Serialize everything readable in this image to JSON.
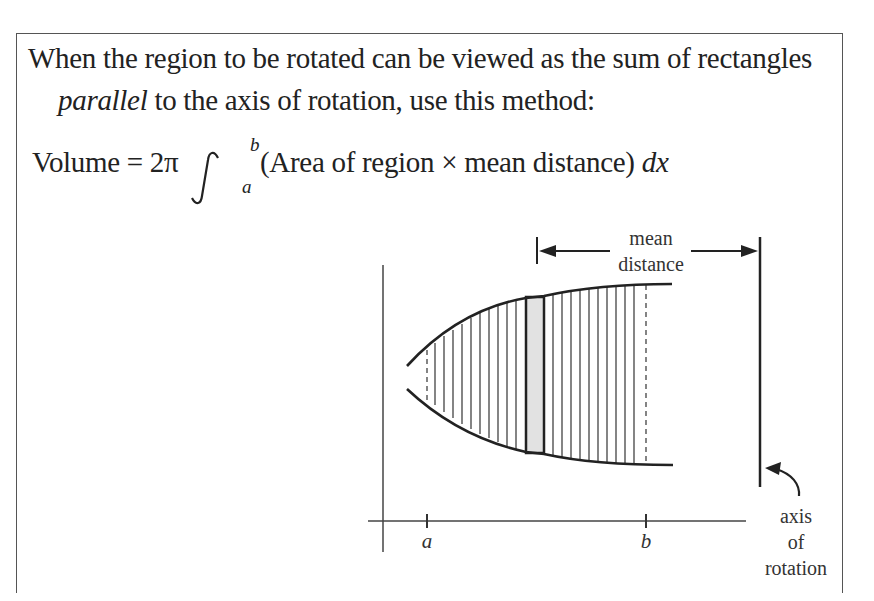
{
  "text": {
    "line1": "When the region to be rotated can be viewed as the sum of rectangles",
    "line2_italic": "parallel",
    "line2_rest": " to the axis of rotation, use this method:"
  },
  "formula": {
    "lhs": "Volume = 2π",
    "integral_sign": "∫",
    "lower_limit": "a",
    "upper_limit": "b",
    "integrand": "(Area of region × mean distance)",
    "differential": "dx"
  },
  "diagram": {
    "mean_distance_label_1": "mean",
    "mean_distance_label_2": "distance",
    "axis_label_1": "axis",
    "axis_label_2": "of",
    "axis_label_3": "rotation",
    "tick_a": "a",
    "tick_b": "b",
    "colors": {
      "stroke": "#333333",
      "shaded_rect": "#e2e2e2"
    }
  }
}
